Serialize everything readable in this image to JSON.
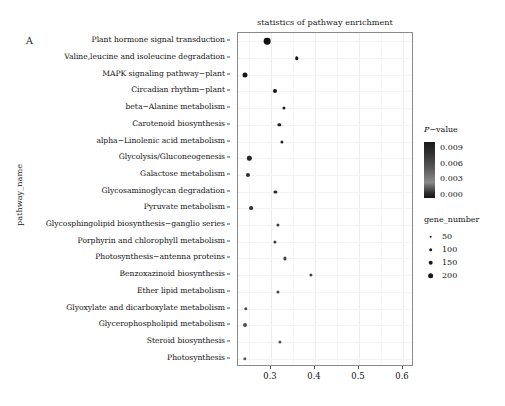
{
  "panel": {
    "label": "A"
  },
  "chart_data": {
    "type": "scatter",
    "title": "statistics of pathway enrichment",
    "xlabel": "",
    "ylabel": "pathway_name",
    "xlim": [
      0.225,
      0.625
    ],
    "xticks": [
      0.3,
      0.4,
      0.5,
      0.6
    ],
    "xtick_labels": [
      "0.3",
      "0.4",
      "0.5",
      "0.6"
    ],
    "grid": true,
    "categories": [
      "Plant hormone signal transduction",
      "Valine,leucine and isoleucine degradation",
      "MAPK signaling pathway−plant",
      "Circadian rhythm−plant",
      "beta−Alanine metabolism",
      "Carotenoid biosynthesis",
      "alpha−Linolenic acid metabolism",
      "Glycolysis/Gluconeogenesis",
      "Galactose metabolism",
      "Glycosaminoglycan degradation",
      "Pyruvate metabolism",
      "Glycosphingolipid biosynthesis−ganglio series",
      "Porphyrin and chlorophyll metabolism",
      "Photosynthesis−antenna proteins",
      "Benzoxazinoid biosynthesis",
      "Ether lipid metabolism",
      "Glyoxylate and dicarboxylate metabolism",
      "Glycerophospholipid metabolism",
      "Steroid biosynthesis",
      "Photosynthesis"
    ],
    "points": [
      {
        "pathway": "Plant hormone signal transduction",
        "rich_factor": 0.291,
        "gene_number": 205,
        "p_value": 0.0002
      },
      {
        "pathway": "Valine,leucine and isoleucine degradation",
        "rich_factor": 0.358,
        "gene_number": 62,
        "p_value": 0.0006
      },
      {
        "pathway": "MAPK signaling pathway−plant",
        "rich_factor": 0.242,
        "gene_number": 118,
        "p_value": 0.001
      },
      {
        "pathway": "Circadian rhythm−plant",
        "rich_factor": 0.308,
        "gene_number": 78,
        "p_value": 0.0013
      },
      {
        "pathway": "beta−Alanine metabolism",
        "rich_factor": 0.33,
        "gene_number": 45,
        "p_value": 0.0019
      },
      {
        "pathway": "Carotenoid biosynthesis",
        "rich_factor": 0.319,
        "gene_number": 56,
        "p_value": 0.0024
      },
      {
        "pathway": "alpha−Linolenic acid metabolism",
        "rich_factor": 0.324,
        "gene_number": 40,
        "p_value": 0.0029
      },
      {
        "pathway": "Glycolysis/Gluconeogenesis",
        "rich_factor": 0.251,
        "gene_number": 88,
        "p_value": 0.0034
      },
      {
        "pathway": "Galactose metabolism",
        "rich_factor": 0.248,
        "gene_number": 82,
        "p_value": 0.004
      },
      {
        "pathway": "Glycosaminoglycan degradation",
        "rich_factor": 0.31,
        "gene_number": 30,
        "p_value": 0.0046
      },
      {
        "pathway": "Pyruvate metabolism",
        "rich_factor": 0.254,
        "gene_number": 70,
        "p_value": 0.0052
      },
      {
        "pathway": "Glycosphingolipid biosynthesis−ganglio series",
        "rich_factor": 0.316,
        "gene_number": 25,
        "p_value": 0.0058
      },
      {
        "pathway": "Porphyrin and chlorophyll metabolism",
        "rich_factor": 0.308,
        "gene_number": 44,
        "p_value": 0.0063
      },
      {
        "pathway": "Photosynthesis−antenna proteins",
        "rich_factor": 0.331,
        "gene_number": 20,
        "p_value": 0.0069
      },
      {
        "pathway": "Benzoxazinoid biosynthesis",
        "rich_factor": 0.39,
        "gene_number": 15,
        "p_value": 0.0074
      },
      {
        "pathway": "Ether lipid metabolism",
        "rich_factor": 0.316,
        "gene_number": 32,
        "p_value": 0.0079
      },
      {
        "pathway": "Glyoxylate and dicarboxylate metabolism",
        "rich_factor": 0.243,
        "gene_number": 58,
        "p_value": 0.0084
      },
      {
        "pathway": "Glycerophospholipid metabolism",
        "rich_factor": 0.24,
        "gene_number": 75,
        "p_value": 0.0089
      },
      {
        "pathway": "Steroid biosynthesis",
        "rich_factor": 0.32,
        "gene_number": 35,
        "p_value": 0.0093
      },
      {
        "pathway": "Photosynthesis",
        "rich_factor": 0.24,
        "gene_number": 55,
        "p_value": 0.0098
      }
    ],
    "legends": {
      "pvalue": {
        "title_italic": "P",
        "title_rest": "−value",
        "ticks": [
          "0.009",
          "0.006",
          "0.003",
          "0.000"
        ],
        "high_color": "#111111",
        "low_color": "#8a8a8a"
      },
      "gene_number": {
        "title": "gene_number",
        "ticks": [
          "50",
          "100",
          "150",
          "200"
        ],
        "sizes": [
          1.7,
          2.3,
          2.9,
          3.6
        ]
      }
    }
  }
}
